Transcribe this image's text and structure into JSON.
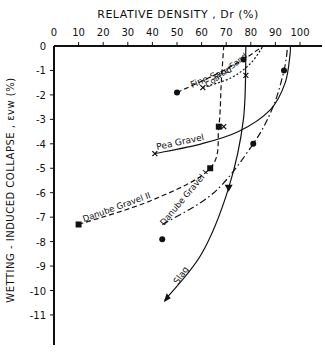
{
  "chart_data": {
    "type": "line",
    "title": "",
    "xlabel": "RELATIVE DENSITY, Dr (%)",
    "ylabel": "WETTING - INDUCED COLLAPSE, εvw (%)",
    "x_axis_position": "top",
    "xlim": [
      0,
      100
    ],
    "ylim": [
      -11.5,
      0
    ],
    "x_ticks": [
      0,
      10,
      20,
      30,
      40,
      50,
      60,
      70,
      80,
      90,
      100
    ],
    "x_tick_labels": [
      "0",
      "10",
      "20",
      "30",
      "40",
      "50",
      "60",
      "70",
      "80",
      "90",
      "100"
    ],
    "y_ticks": [
      0,
      -1,
      -2,
      -3,
      -4,
      -5,
      -6,
      -7,
      -8,
      -9,
      -10,
      -11
    ],
    "y_tick_labels": [
      "0",
      "-1",
      "-2",
      "-3",
      "-4",
      "-5",
      "-6",
      "-7",
      "-8",
      "-9",
      "-10",
      "-11"
    ],
    "grid": false,
    "legend": "inline curve labels",
    "series": [
      {
        "name": "Fine Sand",
        "line_style": "dashed",
        "marker": "circle",
        "points": [
          [
            50,
            -1.9
          ],
          [
            77,
            -0.55
          ]
        ],
        "curve": [
          [
            50,
            -1.9
          ],
          [
            65,
            -1.2
          ],
          [
            77,
            -0.55
          ],
          [
            85,
            0
          ]
        ]
      },
      {
        "name": "Coarse Sand",
        "line_style": "dotted",
        "marker": "x",
        "points": [
          [
            60.5,
            -1.7
          ],
          [
            78,
            -1.2
          ]
        ],
        "curve": [
          [
            60.5,
            -1.7
          ],
          [
            72,
            -1.3
          ],
          [
            80,
            -0.7
          ],
          [
            85,
            0
          ]
        ]
      },
      {
        "name": "Pea Gravel",
        "line_style": "solid",
        "marker": "x",
        "points": [
          [
            41,
            -4.4
          ],
          [
            69,
            -3.3
          ]
        ],
        "curve": [
          [
            41,
            -4.4
          ],
          [
            60,
            -4.0
          ],
          [
            75,
            -3.5
          ],
          [
            88,
            -2.6
          ],
          [
            94,
            -1.5
          ],
          [
            96,
            -0.3
          ],
          [
            96,
            0
          ]
        ]
      },
      {
        "name": "Danube Gravel II",
        "line_style": "dashed",
        "marker": "square",
        "points": [
          [
            10,
            -7.3
          ],
          [
            63.5,
            -5.0
          ],
          [
            67,
            -3.3
          ]
        ],
        "curve": [
          [
            10,
            -7.3
          ],
          [
            40,
            -6.3
          ],
          [
            63.5,
            -5.0
          ],
          [
            67,
            -3.3
          ],
          [
            68,
            -1.5
          ],
          [
            69,
            0
          ]
        ]
      },
      {
        "name": "Danube Gravel I",
        "line_style": "dash-dot",
        "marker": "circle",
        "points": [
          [
            44,
            -7.9
          ],
          [
            81,
            -4.0
          ],
          [
            93.5,
            -1.0
          ]
        ],
        "curve": [
          [
            44,
            -7.3
          ],
          [
            65,
            -6.0
          ],
          [
            81,
            -4.0
          ],
          [
            89,
            -2.5
          ],
          [
            93.5,
            -1.0
          ],
          [
            95,
            0
          ]
        ]
      },
      {
        "name": "Slag",
        "line_style": "solid-arrow",
        "marker": "triangle",
        "points": [
          [
            71,
            -5.8
          ],
          [
            45,
            -10.4
          ]
        ],
        "curve": [
          [
            78,
            0
          ],
          [
            77,
            -3.0
          ],
          [
            71,
            -5.8
          ],
          [
            60,
            -8.5
          ],
          [
            45,
            -10.4
          ]
        ]
      }
    ]
  },
  "labels": {
    "x_title": "RELATIVE DENSITY , Dr (%)",
    "y_title": "WETTING - INDUCED COLLAPSE , εvw (%)",
    "fine_sand": "Fine Sand",
    "coarse_sand": "Coarse Sand",
    "pea_gravel": "Pea Gravel",
    "danube_gravel_2": "Danube Gravel II",
    "danube_gravel_1": "Danube Gravel I",
    "slag": "Slag"
  }
}
